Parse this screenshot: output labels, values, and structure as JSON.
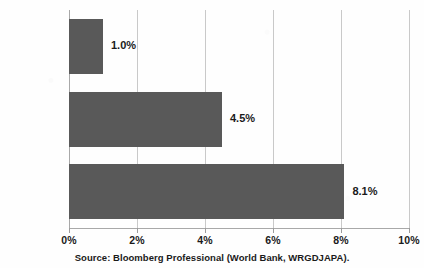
{
  "chart_data": {
    "type": "bar",
    "orientation": "horizontal",
    "title": "",
    "categories": [
      "1991-2017",
      "1975-1990",
      "1961-1974"
    ],
    "values": [
      1.0,
      4.5,
      8.1
    ],
    "data_labels": [
      "1.0%",
      "4.5%",
      "8.1%"
    ],
    "xlabel": "",
    "ylabel": "",
    "xlim": [
      0,
      10
    ],
    "xticks": [
      0,
      2,
      4,
      6,
      8,
      10
    ],
    "xtick_labels": [
      "0%",
      "2%",
      "4%",
      "6%",
      "8%",
      "10%"
    ],
    "grid": "vertical",
    "legend": "none",
    "bar_color": "#595959",
    "gridline_color": "#c9c9c9",
    "text_color": "#1a1a1a",
    "annotations": [
      "Source:  Bloomberg Professional (World Bank, WRGDJAPA)."
    ]
  },
  "source": {
    "text": "Source:  Bloomberg Professional (World Bank, WRGDJAPA)."
  },
  "title_remnant": {
    "text": ""
  }
}
